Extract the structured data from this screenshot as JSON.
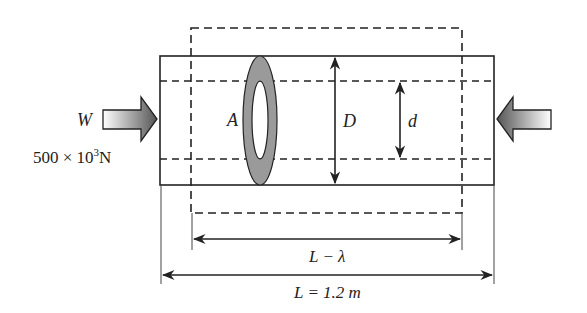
{
  "diagram": {
    "load": {
      "symbol": "W",
      "value_text": "500 × 10",
      "exponent": "3",
      "unit": "N"
    },
    "labels": {
      "area": "A",
      "outer_diameter": "D",
      "inner_diameter": "d",
      "deformed_length": "L − λ",
      "original_length": "L = 1.2 m"
    },
    "colors": {
      "line": "#222222",
      "ring_fill": "#9a9a9a",
      "arrow_dark": "#555555",
      "arrow_light": "#ffffff"
    }
  }
}
